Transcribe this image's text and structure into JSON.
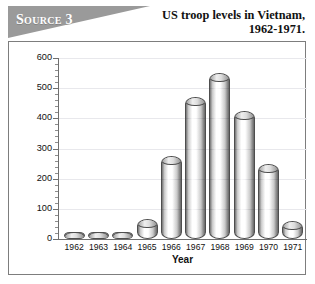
{
  "source_banner": {
    "label": "Source 3"
  },
  "title": {
    "line1": "US troop levels in Vietnam,",
    "line2": "1962-1971."
  },
  "colors": {
    "banner_gray": "#9a9a9a",
    "frame_border": "#7d7d7d",
    "gridline": "#e8e8ec",
    "axis": "#6f6f6f",
    "bar_stripe_dark": "#6b6b6b",
    "bar_stripe_light": "#ffffff",
    "bar_canton": "#d9d9d9",
    "text": "#111111"
  },
  "chart_data": {
    "type": "bar",
    "title": "US troop levels in Vietnam, 1962-1971.",
    "xlabel": "Year",
    "ylabel": "Thousands of US troops in Vietnam",
    "categories": [
      "1962",
      "1963",
      "1964",
      "1965",
      "1966",
      "1967",
      "1968",
      "1969",
      "1970",
      "1971"
    ],
    "values": [
      12,
      16,
      23,
      65,
      275,
      470,
      550,
      425,
      250,
      60
    ],
    "ylim": [
      0,
      600
    ],
    "yticks": [
      0,
      100,
      200,
      300,
      400,
      500,
      600
    ],
    "ytick_labels": [
      "0",
      "100",
      "200",
      "300",
      "400",
      "500",
      "600"
    ],
    "minor_tick_step": 20,
    "grid": true,
    "legend": "none",
    "bar_style": "cylinder-us-flag"
  }
}
